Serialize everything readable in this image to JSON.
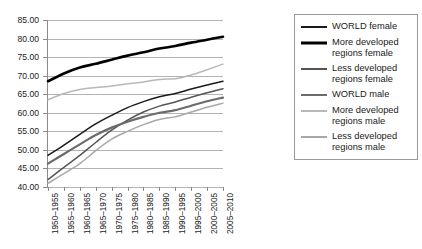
{
  "chart_data": {
    "type": "line",
    "title": "",
    "subtitle": "",
    "xlabel": "",
    "ylabel": "",
    "ylim": [
      40,
      85
    ],
    "ytick_labels": [
      "85.00",
      "80.00",
      "75.00",
      "70.00",
      "65.00",
      "60.00",
      "55.00",
      "50.00",
      "45.00",
      "40.00"
    ],
    "ytick_values": [
      85,
      80,
      75,
      70,
      65,
      60,
      55,
      50,
      45,
      40
    ],
    "grid": true,
    "legend_position": "right",
    "categories": [
      "1950–1955",
      "1955–1960",
      "1960–1965",
      "1965–1970",
      "1970–1975",
      "1975–1980",
      "1980–1985",
      "1985–1990",
      "1990–1995",
      "1995–2000",
      "2000–2005",
      "2005–2010"
    ],
    "series": [
      {
        "name": "WORLD female",
        "color": "#1a1a1a",
        "width": 1.5,
        "values": [
          48.5,
          51.3,
          54.2,
          57.0,
          59.3,
          61.4,
          63.0,
          64.3,
          65.2,
          66.4,
          67.5,
          68.5
        ]
      },
      {
        "name": "More developed regions female",
        "color": "#000000",
        "width": 2.6,
        "values": [
          68.5,
          70.6,
          72.2,
          73.2,
          74.3,
          75.4,
          76.3,
          77.3,
          78.0,
          78.9,
          79.7,
          80.5
        ]
      },
      {
        "name": "Less developed regions female",
        "color": "#555555",
        "width": 1.5,
        "values": [
          42.0,
          45.3,
          48.5,
          52.0,
          55.3,
          58.0,
          60.2,
          61.8,
          62.9,
          64.2,
          65.4,
          66.5
        ]
      },
      {
        "name": "WORLD male",
        "color": "#6b6b6b",
        "width": 2.2,
        "values": [
          46.3,
          48.9,
          51.5,
          54.0,
          56.0,
          57.6,
          58.9,
          60.0,
          60.7,
          61.9,
          63.1,
          64.1
        ]
      },
      {
        "name": "More developed regions male",
        "color": "#b8b8b8",
        "width": 1.5,
        "values": [
          63.5,
          65.2,
          66.3,
          66.8,
          67.2,
          67.8,
          68.3,
          69.0,
          69.2,
          70.2,
          71.6,
          73.1
        ]
      },
      {
        "name": "Less developed regions male",
        "color": "#a8a8a8",
        "width": 1.5,
        "values": [
          41.0,
          43.6,
          46.3,
          49.8,
          52.9,
          55.0,
          56.8,
          58.2,
          58.9,
          60.2,
          61.5,
          62.6
        ]
      }
    ]
  },
  "legend": {
    "items": [
      {
        "label": "WORLD female"
      },
      {
        "label": "More developed regions female"
      },
      {
        "label": "Less developed regions female"
      },
      {
        "label": "WORLD male"
      },
      {
        "label": "More developed regions male"
      },
      {
        "label": "Less developed regions male"
      }
    ]
  }
}
